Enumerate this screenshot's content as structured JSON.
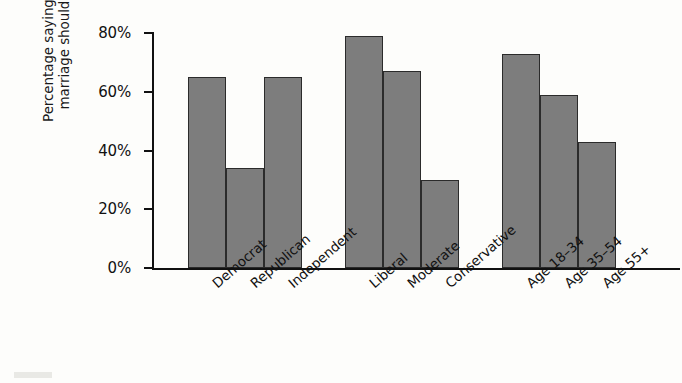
{
  "chart_data": {
    "type": "bar",
    "title": "",
    "xlabel": "",
    "ylabel_line1": "Percentage saying same-sex",
    "ylabel_line2": "marriage should be legal",
    "ylim": [
      0,
      80
    ],
    "ytick_values": [
      0,
      20,
      40,
      60,
      80
    ],
    "ytick_labels": [
      "0%",
      "20%",
      "40%",
      "60%",
      "80%"
    ],
    "grid": false,
    "legend": "none",
    "bar_color": "#7d7d7d",
    "bar_outline_color": "#2b2b2b",
    "axis_color": "#111111",
    "groups": [
      {
        "name": "Party",
        "categories": [
          "Democrat",
          "Republican",
          "Independent"
        ],
        "values": [
          65,
          34,
          65
        ]
      },
      {
        "name": "Ideology",
        "categories": [
          "Liberal",
          "Moderate",
          "Conservative"
        ],
        "values": [
          79,
          67,
          30
        ]
      },
      {
        "name": "Age",
        "categories": [
          "Age 18–34",
          "Age 35–54",
          "Age 55+"
        ],
        "values": [
          73,
          59,
          43
        ]
      }
    ],
    "categories": [
      "Democrat",
      "Republican",
      "Independent",
      "Liberal",
      "Moderate",
      "Conservative",
      "Age 18–34",
      "Age 35–54",
      "Age 55+"
    ],
    "values": [
      65,
      34,
      65,
      79,
      67,
      30,
      73,
      59,
      43
    ]
  }
}
